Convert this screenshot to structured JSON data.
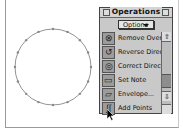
{
  "canvas": {
    "glyph": {
      "shape": "circle",
      "center": [
        53,
        67
      ],
      "radius": 38,
      "point_count": 16,
      "stroke": "#777777",
      "point_color": "#888888"
    }
  },
  "palette": {
    "title": "Operations",
    "dropdown_label": "Options",
    "items": [
      {
        "label": "Remove Overlap",
        "icon": "remove-overlap-icon",
        "glyph": "⊗"
      },
      {
        "label": "Reverse Direction",
        "icon": "reverse-direction-icon",
        "glyph": "↺"
      },
      {
        "label": "Correct Direction",
        "icon": "correct-direction-icon",
        "glyph": "◎"
      },
      {
        "label": "Set Note",
        "icon": "note-icon",
        "glyph": "▭"
      },
      {
        "label": "Envelope...",
        "icon": "envelope-icon",
        "glyph": "▱"
      },
      {
        "label": "Add Points",
        "icon": "add-points-icon",
        "glyph": "∫∫"
      }
    ],
    "scroll_up_glyph": "⇧",
    "scroll_down_glyph": "⇩"
  }
}
